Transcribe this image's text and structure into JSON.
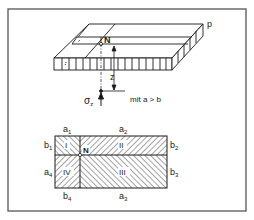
{
  "figure": {
    "labels": {
      "p": "p",
      "n_top": "N",
      "z": "z",
      "sigma": "σ",
      "sigma_sub": "z",
      "condition": "mit a > b"
    },
    "plan": {
      "a1": "a",
      "a1_sub": "1",
      "a2": "a",
      "a2_sub": "2",
      "a3": "a",
      "a3_sub": "3",
      "a4": "a",
      "a4_sub": "4",
      "b1": "b",
      "b1_sub": "1",
      "b2": "b",
      "b2_sub": "2",
      "b3": "b",
      "b3_sub": "3",
      "b4": "b",
      "b4_sub": "4",
      "region_1": "I",
      "region_2": "II",
      "region_3": "III",
      "region_4": "IV",
      "n_plan": "N"
    },
    "colors": {
      "line": "#1a1a1a",
      "frame": "#555555",
      "background": "#ffffff"
    }
  }
}
